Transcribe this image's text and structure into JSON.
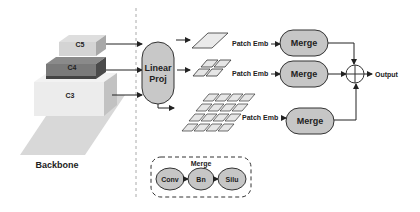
{
  "backbone": {
    "label": "Backbone",
    "layers": [
      {
        "name": "C5",
        "color": "#d4d4d4",
        "side": "#a8a8a8"
      },
      {
        "name": "C4",
        "color": "#7a7a7a",
        "side": "#4a4a4a"
      },
      {
        "name": "C3",
        "color": "#ececec",
        "side": "#c2c2c2"
      }
    ],
    "base_color": "#d8d8d8"
  },
  "proj": {
    "line1": "Linear",
    "line2": "Proj",
    "fill": "#c8c8c8"
  },
  "branches": [
    {
      "patch_label": "Patch Emb",
      "merge_label": "Merge"
    },
    {
      "patch_label": "Patch Emb",
      "merge_label": "Merge"
    },
    {
      "patch_label": "Patch Emb",
      "merge_label": "Merge"
    }
  ],
  "output_label": "Output",
  "merge_legend": {
    "title": "Merge",
    "ops": [
      "Conv",
      "Bn",
      "Silu"
    ]
  },
  "colors": {
    "node_fill": "#c6c6c6",
    "stroke": "#333333",
    "tile": "#e6e6e6"
  }
}
